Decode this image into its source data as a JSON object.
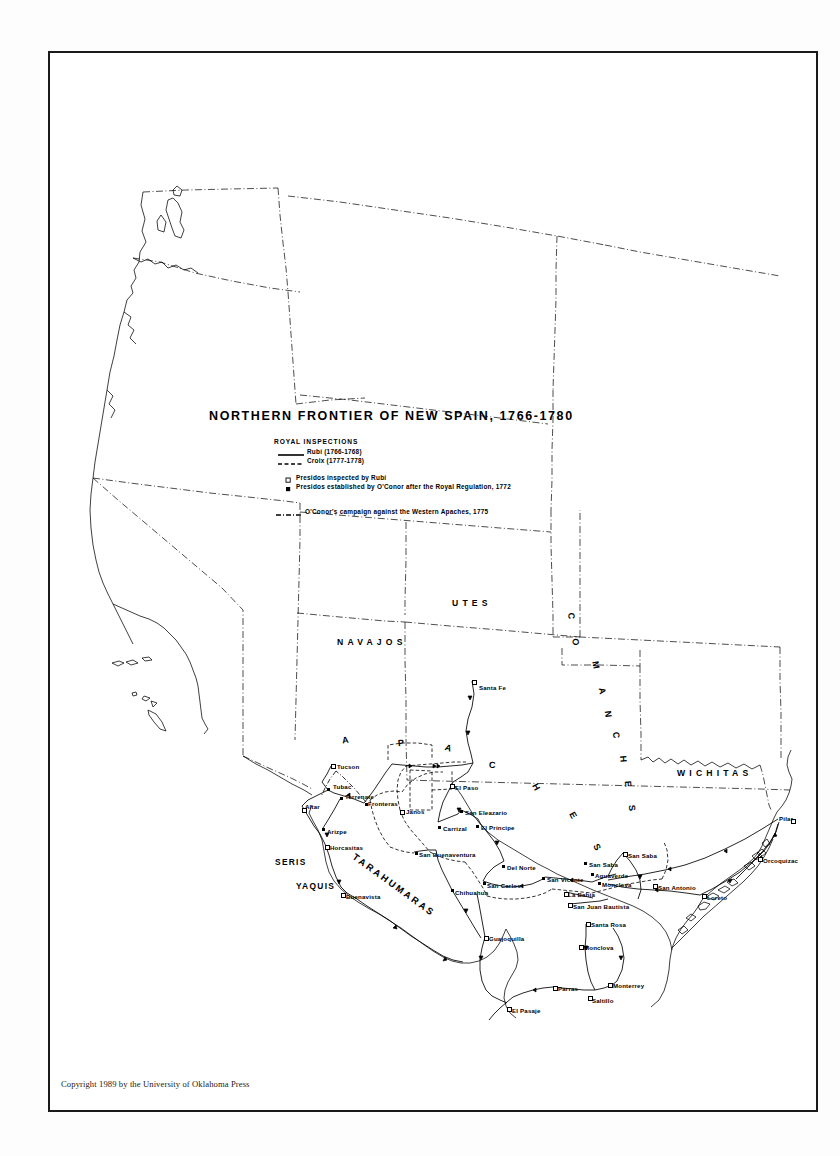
{
  "page": {
    "background": "#ffffff",
    "ink": "#000000",
    "frame_color": "#1a1a1a"
  },
  "title": "NORTHERN FRONTIER OF NEW SPAIN, 1766-1780",
  "legend": {
    "heading": "ROYAL INSPECTIONS",
    "routes": [
      {
        "label": "Rubí (1766-1768)",
        "style": "solid"
      },
      {
        "label": "Croix (1777-1778)",
        "style": "dashed"
      }
    ],
    "symbols": [
      {
        "label": "Presidos inspected by Rubí",
        "marker": "hollow-square"
      },
      {
        "label": "Presidos established by O'Conor after the  Royal Regulation, 1772",
        "marker": "filled-square"
      }
    ],
    "campaign": {
      "label": "O'Conor's  campaign against the  Western  Apaches, 1775",
      "style": "dash-dot"
    }
  },
  "tribes": [
    {
      "name": "UTES",
      "x": 452,
      "y": 598,
      "class": "tribe"
    },
    {
      "name": "NAVAJOS",
      "x": 337,
      "y": 637,
      "class": "tribe"
    },
    {
      "name": "WICHITAS",
      "x": 677,
      "y": 768,
      "class": "tribe"
    },
    {
      "name": "SERIS",
      "x": 275,
      "y": 857,
      "class": "tribe-sm"
    },
    {
      "name": "YAQUIS",
      "x": 296,
      "y": 881,
      "class": "tribe-sm"
    }
  ],
  "curved_tribes": [
    {
      "name": "APACHES",
      "letters": [
        {
          "ch": "A",
          "x": 342,
          "y": 735,
          "rot": -8
        },
        {
          "ch": "P",
          "x": 398,
          "y": 738,
          "rot": -6
        },
        {
          "ch": "A",
          "x": 445,
          "y": 743,
          "rot": 18
        },
        {
          "ch": "C",
          "x": 489,
          "y": 760,
          "rot": 4
        },
        {
          "ch": "H",
          "x": 533,
          "y": 782,
          "rot": 62
        },
        {
          "ch": "E",
          "x": 570,
          "y": 810,
          "rot": 60
        },
        {
          "ch": "S",
          "x": 594,
          "y": 842,
          "rot": 62
        }
      ]
    },
    {
      "name": "COMANCHES",
      "letters": [
        {
          "ch": "C",
          "x": 568,
          "y": 611,
          "rot": 88
        },
        {
          "ch": "O",
          "x": 572,
          "y": 637,
          "rot": 88
        },
        {
          "ch": "M",
          "x": 592,
          "y": 660,
          "rot": 80
        },
        {
          "ch": "A",
          "x": 599,
          "y": 686,
          "rot": 80
        },
        {
          "ch": "N",
          "x": 605,
          "y": 709,
          "rot": 82
        },
        {
          "ch": "C",
          "x": 613,
          "y": 730,
          "rot": 82
        },
        {
          "ch": "H",
          "x": 620,
          "y": 754,
          "rot": 84
        },
        {
          "ch": "E",
          "x": 625,
          "y": 779,
          "rot": 84
        },
        {
          "ch": "S",
          "x": 629,
          "y": 803,
          "rot": 84
        }
      ]
    }
  ],
  "tarahumaras": {
    "name": "TARAHUMARAS",
    "x": 357,
    "y": 851,
    "rot": 36
  },
  "places": [
    {
      "name": "Santa Fe",
      "x": 479,
      "y": 684,
      "marker": "hollow",
      "mx": 472,
      "my": 680
    },
    {
      "name": "Tucson",
      "x": 337,
      "y": 763,
      "marker": "hollow",
      "mx": 331,
      "my": 764
    },
    {
      "name": "Tubac",
      "x": 333,
      "y": 783,
      "marker": "filled",
      "mx": 327,
      "my": 788
    },
    {
      "name": "Terrenate",
      "x": 345,
      "y": 793,
      "marker": "filled",
      "mx": 340,
      "my": 797
    },
    {
      "name": "Altar",
      "x": 305,
      "y": 803,
      "marker": "hollow",
      "mx": 302,
      "my": 808
    },
    {
      "name": "Fronteras",
      "x": 368,
      "y": 800,
      "marker": "filled",
      "mx": 365,
      "my": 803
    },
    {
      "name": "Janos",
      "x": 406,
      "y": 808,
      "marker": "hollow",
      "mx": 400,
      "my": 810
    },
    {
      "name": "El Paso",
      "x": 455,
      "y": 784,
      "marker": "hollow",
      "mx": 450,
      "my": 784
    },
    {
      "name": "San Eleazario",
      "x": 465,
      "y": 809,
      "marker": "filled",
      "mx": 460,
      "my": 810
    },
    {
      "name": "Arizpe",
      "x": 327,
      "y": 828,
      "marker": "filled",
      "mx": 322,
      "my": 828
    },
    {
      "name": "Carrizal",
      "x": 443,
      "y": 825,
      "marker": "filled",
      "mx": 438,
      "my": 826
    },
    {
      "name": "El Principe",
      "x": 481,
      "y": 824,
      "marker": "filled",
      "mx": 476,
      "my": 825
    },
    {
      "name": "Horcasitas",
      "x": 330,
      "y": 844,
      "marker": "hollow",
      "mx": 325,
      "my": 845
    },
    {
      "name": "San Buenaventura",
      "x": 419,
      "y": 851,
      "marker": "filled",
      "mx": 415,
      "my": 852
    },
    {
      "name": "Del Norte",
      "x": 507,
      "y": 864,
      "marker": "filled",
      "mx": 502,
      "my": 865
    },
    {
      "name": "San Carlos",
      "x": 487,
      "y": 882,
      "marker": "filled",
      "mx": 483,
      "my": 882
    },
    {
      "name": "San Vicente",
      "x": 547,
      "y": 876,
      "marker": "filled",
      "mx": 542,
      "my": 877
    },
    {
      "name": "San Saba",
      "x": 628,
      "y": 852,
      "marker": "hollow",
      "mx": 623,
      "my": 852
    },
    {
      "name": "San Saba",
      "x": 589,
      "y": 861,
      "marker": "filled",
      "mx": 584,
      "my": 862
    },
    {
      "name": "Aguaverde",
      "x": 595,
      "y": 872,
      "marker": "filled",
      "mx": 591,
      "my": 873
    },
    {
      "name": "Monclova",
      "x": 602,
      "y": 881,
      "marker": "filled",
      "mx": 598,
      "my": 882
    },
    {
      "name": "San Antonio",
      "x": 658,
      "y": 884,
      "marker": "hollow",
      "mx": 653,
      "my": 884
    },
    {
      "name": "La Bahia",
      "x": 568,
      "y": 891,
      "marker": "hollow",
      "mx": 564,
      "my": 892
    },
    {
      "name": "San Juan Bautista",
      "x": 573,
      "y": 903,
      "marker": "hollow",
      "mx": 568,
      "my": 903
    },
    {
      "name": "Loreto",
      "x": 707,
      "y": 894,
      "marker": "hollow",
      "mx": 702,
      "my": 894
    },
    {
      "name": "Pilar",
      "x": 779,
      "y": 815,
      "marker": "hollow",
      "mx": 791,
      "my": 819
    },
    {
      "name": "Orcoquizac",
      "x": 763,
      "y": 857,
      "marker": "hollow",
      "mx": 758,
      "my": 857
    },
    {
      "name": "Santa Rosa",
      "x": 591,
      "y": 921,
      "marker": "hollow",
      "mx": 586,
      "my": 922
    },
    {
      "name": "Buenavista",
      "x": 346,
      "y": 893,
      "marker": "hollow",
      "mx": 341,
      "my": 893
    },
    {
      "name": "Chihuahua",
      "x": 455,
      "y": 889,
      "marker": "filled",
      "mx": 451,
      "my": 889
    },
    {
      "name": "Monclova",
      "x": 584,
      "y": 944,
      "marker": "hollow",
      "mx": 579,
      "my": 945
    },
    {
      "name": "Guajoquilla",
      "x": 489,
      "y": 935,
      "marker": "hollow",
      "mx": 484,
      "my": 936
    },
    {
      "name": "Parras",
      "x": 558,
      "y": 985,
      "marker": "hollow",
      "mx": 553,
      "my": 986
    },
    {
      "name": "Saltillo",
      "x": 592,
      "y": 997,
      "marker": "hollow",
      "mx": 588,
      "my": 996
    },
    {
      "name": "Monterrey",
      "x": 613,
      "y": 982,
      "marker": "hollow",
      "mx": 608,
      "my": 983
    },
    {
      "name": "El Pasaje",
      "x": 512,
      "y": 1007,
      "marker": "hollow",
      "mx": 507,
      "my": 1007
    }
  ],
  "copyright": "Copyright 1989 by the University of Oklahoma Press"
}
